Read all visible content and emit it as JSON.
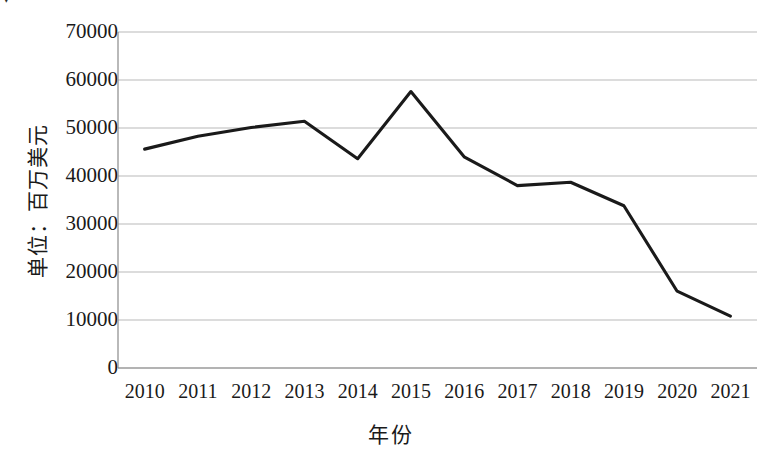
{
  "chart_data": {
    "type": "line",
    "title": "",
    "xlabel": "年份",
    "ylabel": "单位：百万美元",
    "categories": [
      "2010",
      "2011",
      "2012",
      "2013",
      "2014",
      "2015",
      "2016",
      "2017",
      "2018",
      "2019",
      "2020",
      "2021"
    ],
    "values": [
      45600,
      48300,
      50100,
      51400,
      43600,
      57600,
      44000,
      38000,
      38700,
      33800,
      16000,
      10800
    ],
    "series": [
      {
        "name": "单位：百万美元",
        "values": [
          45600,
          48300,
          50100,
          51400,
          43600,
          57600,
          44000,
          38000,
          38700,
          33800,
          16000,
          10800
        ]
      }
    ],
    "ylim": [
      0,
      70000
    ],
    "yticks": [
      0,
      10000,
      20000,
      30000,
      40000,
      50000,
      60000,
      70000
    ],
    "ytick_labels": [
      "0",
      "10000",
      "20000",
      "30000",
      "40000",
      "50000",
      "60000",
      "70000"
    ],
    "grid": true,
    "grid_axis": "y",
    "legend": false,
    "legend_position": "none",
    "line_color": "#1a1a1a",
    "grid_color": "#b9b9b9",
    "axis_color": "#7a7a7a",
    "background": "#ffffff"
  },
  "axes": {
    "y_title": "单位：百万美元",
    "x_title": "年份"
  },
  "artifact": {
    "top_left_mark": "▾"
  }
}
